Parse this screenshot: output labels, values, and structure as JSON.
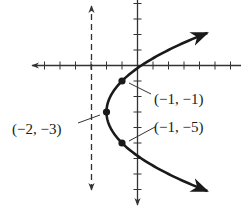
{
  "diagram": {
    "type": "parabola-graph",
    "equation_form": "(y + 3)^2 = 4(x + 2)",
    "vertex": {
      "x": -2,
      "y": -3,
      "label": "(−2, −3)"
    },
    "points": [
      {
        "x": -1,
        "y": -1,
        "label": "(−1, −1)"
      },
      {
        "x": -1,
        "y": -5,
        "label": "(−1, −5)"
      }
    ],
    "directrix": {
      "x": -3,
      "style": "dashed"
    },
    "axes": {
      "x_ticks_min": -6,
      "x_ticks_max": 6,
      "y_ticks_min": -9,
      "y_ticks_max": 4,
      "tick_spacing": 1
    },
    "colors": {
      "ink": "#1a1a1a",
      "background": "#ffffff"
    }
  }
}
